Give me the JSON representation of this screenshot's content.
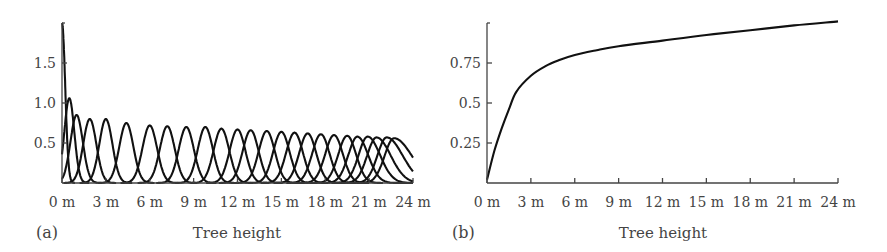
{
  "figure": {
    "panel_a": {
      "label": "(a)",
      "xlabel": "Tree height"
    },
    "panel_b": {
      "label": "(b)",
      "xlabel": "Tree height"
    }
  },
  "chart_data": [
    {
      "type": "line",
      "panel": "(a)",
      "title": "",
      "xlabel": "Tree height",
      "ylabel": "",
      "x_unit": "m",
      "xlim": [
        0,
        24
      ],
      "ylim": [
        0,
        2.0
      ],
      "xticks": [
        "0 m",
        "3 m",
        "6 m",
        "9 m",
        "12 m",
        "15 m",
        "18 m",
        "21 m",
        "24 m"
      ],
      "xtick_values": [
        0,
        3,
        6,
        9,
        12,
        15,
        18,
        21,
        24
      ],
      "yticks": [
        "0.5",
        "1.0",
        "1.5"
      ],
      "ytick_values": [
        0.5,
        1.0,
        1.5
      ],
      "grid": false,
      "legend": null,
      "description": "Family of overlapping bell-shaped density curves (basis functions) along tree height; narrow and tall near 0 m, wider and lower further up; last curves truncated at 24 m",
      "series": [
        {
          "name": "curve 1",
          "peak_x": 0.0,
          "peak_y": 2.0
        },
        {
          "name": "curve 2",
          "peak_x": 0.5,
          "peak_y": 1.06
        },
        {
          "name": "curve 3",
          "peak_x": 1.0,
          "peak_y": 0.85
        },
        {
          "name": "curve 4",
          "peak_x": 1.9,
          "peak_y": 0.8
        },
        {
          "name": "curve 5",
          "peak_x": 3.0,
          "peak_y": 0.8
        },
        {
          "name": "curve 6",
          "peak_x": 4.4,
          "peak_y": 0.75
        },
        {
          "name": "curve 7",
          "peak_x": 6.0,
          "peak_y": 0.72
        },
        {
          "name": "curve 8",
          "peak_x": 7.2,
          "peak_y": 0.71
        },
        {
          "name": "curve 9",
          "peak_x": 8.5,
          "peak_y": 0.7
        },
        {
          "name": "curve 10",
          "peak_x": 9.8,
          "peak_y": 0.7
        },
        {
          "name": "curve 11",
          "peak_x": 10.9,
          "peak_y": 0.68
        },
        {
          "name": "curve 12",
          "peak_x": 12.0,
          "peak_y": 0.67
        },
        {
          "name": "curve 13",
          "peak_x": 12.9,
          "peak_y": 0.66
        },
        {
          "name": "curve 14",
          "peak_x": 14.0,
          "peak_y": 0.65
        },
        {
          "name": "curve 15",
          "peak_x": 15.0,
          "peak_y": 0.64
        },
        {
          "name": "curve 16",
          "peak_x": 15.9,
          "peak_y": 0.63
        },
        {
          "name": "curve 17",
          "peak_x": 16.8,
          "peak_y": 0.62
        },
        {
          "name": "curve 18",
          "peak_x": 17.7,
          "peak_y": 0.61
        },
        {
          "name": "curve 19",
          "peak_x": 18.6,
          "peak_y": 0.6
        },
        {
          "name": "curve 20",
          "peak_x": 19.5,
          "peak_y": 0.59
        },
        {
          "name": "curve 21",
          "peak_x": 20.2,
          "peak_y": 0.58
        },
        {
          "name": "curve 22",
          "peak_x": 20.9,
          "peak_y": 0.58
        },
        {
          "name": "curve 23",
          "peak_x": 21.5,
          "peak_y": 0.57
        },
        {
          "name": "curve 24",
          "peak_x": 22.2,
          "peak_y": 0.57
        },
        {
          "name": "curve 25",
          "peak_x": 22.7,
          "peak_y": 0.56
        }
      ]
    },
    {
      "type": "line",
      "panel": "(b)",
      "title": "",
      "xlabel": "Tree height",
      "ylabel": "",
      "x_unit": "m",
      "xlim": [
        0,
        24
      ],
      "ylim": [
        0,
        1.0
      ],
      "xticks": [
        "0 m",
        "3 m",
        "6 m",
        "9 m",
        "12 m",
        "15 m",
        "18 m",
        "21 m",
        "24 m"
      ],
      "xtick_values": [
        0,
        3,
        6,
        9,
        12,
        15,
        18,
        21,
        24
      ],
      "yticks": [
        "0.25",
        "0.5",
        "0.75"
      ],
      "ytick_values": [
        0.25,
        0.5,
        0.75
      ],
      "grid": false,
      "legend": null,
      "series": [
        {
          "name": "cumulative curve",
          "x": [
            0,
            0.5,
            1,
            1.5,
            2,
            3,
            4,
            5,
            6,
            7.5,
            9,
            12,
            15,
            18,
            21,
            24
          ],
          "y": [
            0.02,
            0.2,
            0.34,
            0.46,
            0.57,
            0.67,
            0.73,
            0.77,
            0.8,
            0.83,
            0.855,
            0.89,
            0.925,
            0.955,
            0.985,
            1.01
          ]
        }
      ]
    }
  ]
}
